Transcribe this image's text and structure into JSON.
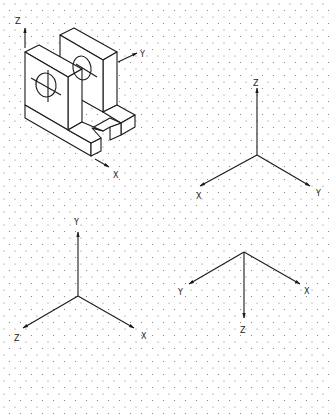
{
  "figure": {
    "grid": {
      "type": "isometric-dot",
      "spacing_x": 11,
      "spacing_y": 13,
      "dot_color": "#777777"
    },
    "line_color": "#1a1a1a"
  },
  "object": {
    "axis_labels": {
      "z": "Z",
      "y": "Y",
      "x": "X"
    }
  },
  "axes_sets": [
    {
      "name": "upper-right",
      "labels": {
        "up": "Z",
        "left": "X",
        "right": "Y"
      }
    },
    {
      "name": "lower-left",
      "labels": {
        "up": "Y",
        "left": "Z",
        "right": "X"
      }
    },
    {
      "name": "lower-right",
      "labels": {
        "down": "Z",
        "left": "Y",
        "right": "X"
      }
    }
  ]
}
